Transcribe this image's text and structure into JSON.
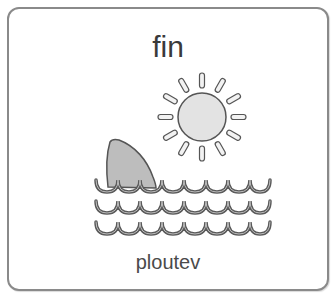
{
  "card": {
    "title": "fin",
    "caption": "ploutev",
    "illustration": {
      "icons": [
        "sun-icon",
        "shark-fin-icon",
        "waves-icon"
      ],
      "colors": {
        "outline": "#555555",
        "fill": "#d9d9d9",
        "fin_fill": "#bdbdbd",
        "border": "#8a8a8a"
      }
    }
  }
}
